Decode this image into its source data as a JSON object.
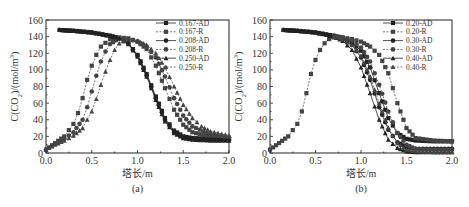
{
  "chart_data": [
    {
      "type": "line",
      "panel_label": "(a)",
      "title": "",
      "xlabel": "塔长/m",
      "ylabel": "C(CO2)/(mol/m3)",
      "ylabel_parts": {
        "pre": "C(CO",
        "sub": "2",
        "mid": ")/(mol/m",
        "sup": "3",
        "post": ")"
      },
      "xlim": [
        0.0,
        2.0
      ],
      "ylim": [
        0,
        160
      ],
      "xticks": [
        0.0,
        0.5,
        1.0,
        1.5,
        2.0
      ],
      "xtick_labels": [
        "0.0",
        "0.5",
        "1.0",
        "1.5",
        "2.0"
      ],
      "yticks": [
        0,
        20,
        40,
        60,
        80,
        100,
        120,
        140,
        160
      ],
      "ytick_labels": [
        "0",
        "20",
        "40",
        "60",
        "80",
        "100",
        "120",
        "140",
        "160"
      ],
      "grid": false,
      "legend_position": "top-right",
      "series": [
        {
          "name": "0.167-AD",
          "style": "solid",
          "marker": "square",
          "x": [
            0.15,
            0.3,
            0.5,
            0.7,
            0.8,
            0.9,
            1.0,
            1.1,
            1.2,
            1.3,
            1.4,
            1.5,
            1.6,
            1.8,
            2.0
          ],
          "y": [
            148,
            147,
            145,
            141,
            138,
            132,
            118,
            95,
            68,
            42,
            27,
            20,
            18,
            17,
            17
          ]
        },
        {
          "name": "0.167-R",
          "style": "dashed",
          "marker": "square",
          "x": [
            0.0,
            0.1,
            0.2,
            0.3,
            0.35,
            0.4,
            0.45,
            0.5,
            0.55,
            0.6,
            0.7,
            0.8,
            0.9,
            1.0,
            1.1,
            1.2,
            1.3,
            1.4,
            1.5,
            1.6,
            1.8,
            2.0
          ],
          "y": [
            4,
            12,
            20,
            35,
            48,
            66,
            88,
            105,
            118,
            128,
            137,
            139,
            138,
            134,
            125,
            105,
            78,
            52,
            34,
            25,
            19,
            17
          ]
        },
        {
          "name": "0.208-AD",
          "style": "solid",
          "marker": "circle",
          "x": [
            0.15,
            0.3,
            0.5,
            0.7,
            0.8,
            0.9,
            1.0,
            1.1,
            1.2,
            1.3,
            1.4,
            1.5,
            1.6,
            1.8,
            2.0
          ],
          "y": [
            148,
            147,
            145,
            141,
            138,
            132,
            117,
            93,
            66,
            40,
            25,
            19,
            17,
            16,
            16
          ]
        },
        {
          "name": "0.208-R",
          "style": "dashed",
          "marker": "circle",
          "x": [
            0.0,
            0.1,
            0.2,
            0.3,
            0.4,
            0.45,
            0.5,
            0.55,
            0.6,
            0.65,
            0.7,
            0.8,
            0.9,
            1.0,
            1.1,
            1.2,
            1.3,
            1.4,
            1.5,
            1.6,
            1.8,
            2.0
          ],
          "y": [
            4,
            11,
            17,
            25,
            40,
            55,
            74,
            93,
            110,
            122,
            131,
            138,
            137,
            134,
            128,
            115,
            92,
            66,
            45,
            32,
            22,
            19
          ]
        },
        {
          "name": "0.250-AD",
          "style": "solid",
          "marker": "triangle",
          "x": [
            0.15,
            0.3,
            0.5,
            0.7,
            0.8,
            0.9,
            1.0,
            1.1,
            1.2,
            1.3,
            1.4,
            1.5,
            1.6,
            1.8,
            2.0
          ],
          "y": [
            148,
            147,
            145,
            141,
            138,
            131,
            116,
            92,
            64,
            38,
            24,
            18,
            16,
            15,
            15
          ]
        },
        {
          "name": "0.250-R",
          "style": "dashed",
          "marker": "triangle",
          "x": [
            0.0,
            0.1,
            0.2,
            0.3,
            0.4,
            0.5,
            0.55,
            0.6,
            0.65,
            0.7,
            0.75,
            0.8,
            0.9,
            1.0,
            1.1,
            1.2,
            1.3,
            1.4,
            1.5,
            1.6,
            1.7,
            1.8,
            2.0
          ],
          "y": [
            4,
            10,
            15,
            21,
            30,
            50,
            65,
            82,
            98,
            112,
            124,
            132,
            137,
            135,
            130,
            120,
            103,
            80,
            58,
            42,
            32,
            26,
            21
          ]
        }
      ]
    },
    {
      "type": "line",
      "panel_label": "(b)",
      "title": "",
      "xlabel": "塔长/m",
      "ylabel": "C(CO2)/(mol/m3)",
      "ylabel_parts": {
        "pre": "C(CO",
        "sub": "2",
        "mid": ")/(mol/m",
        "sup": "3",
        "post": ")"
      },
      "xlim": [
        0.0,
        2.0
      ],
      "ylim": [
        0,
        160
      ],
      "xticks": [
        0.0,
        0.5,
        1.0,
        1.5,
        2.0
      ],
      "xtick_labels": [
        "0.0",
        "0.5",
        "1.0",
        "1.5",
        "2.0"
      ],
      "yticks": [
        0,
        20,
        40,
        60,
        80,
        100,
        120,
        140,
        160
      ],
      "ytick_labels": [
        "0",
        "20",
        "40",
        "60",
        "80",
        "100",
        "120",
        "140",
        "160"
      ],
      "grid": false,
      "legend_position": "top-right",
      "series": [
        {
          "name": "0.20-AD",
          "style": "solid",
          "marker": "square",
          "x": [
            0.15,
            0.3,
            0.5,
            0.7,
            0.8,
            0.9,
            1.0,
            1.1,
            1.2,
            1.3,
            1.4,
            1.5,
            1.6,
            1.8,
            2.0
          ],
          "y": [
            148,
            147,
            145,
            141,
            138,
            133,
            123,
            103,
            72,
            42,
            24,
            17,
            15,
            14,
            14
          ]
        },
        {
          "name": "0.20-R",
          "style": "dashed",
          "marker": "square",
          "x": [
            0.0,
            0.1,
            0.2,
            0.3,
            0.35,
            0.4,
            0.45,
            0.5,
            0.55,
            0.6,
            0.65,
            0.7,
            0.8,
            0.9,
            1.0,
            1.1,
            1.2,
            1.3,
            1.4,
            1.5,
            1.6,
            1.8,
            2.0
          ],
          "y": [
            4,
            12,
            20,
            35,
            50,
            72,
            95,
            112,
            124,
            132,
            137,
            139,
            139,
            137,
            134,
            128,
            118,
            96,
            60,
            30,
            18,
            15,
            14
          ]
        },
        {
          "name": "0.30-AD",
          "style": "solid",
          "marker": "circle",
          "x": [
            0.15,
            0.3,
            0.5,
            0.7,
            0.8,
            0.9,
            1.0,
            1.1,
            1.2,
            1.3,
            1.4,
            1.5,
            1.6,
            1.8,
            2.0
          ],
          "y": [
            148,
            147,
            145,
            141,
            137,
            130,
            115,
            88,
            55,
            28,
            13,
            7,
            5,
            5,
            5
          ]
        },
        {
          "name": "0.30-R",
          "style": "dashed",
          "marker": "circle",
          "x": [
            0.7,
            0.8,
            0.9,
            1.0,
            1.1,
            1.2,
            1.3,
            1.4,
            1.5,
            1.6,
            1.8,
            2.0
          ],
          "y": [
            141,
            139,
            135,
            127,
            110,
            82,
            50,
            24,
            10,
            5,
            4,
            4
          ]
        },
        {
          "name": "0.40-AD",
          "style": "solid",
          "marker": "triangle",
          "x": [
            0.15,
            0.3,
            0.5,
            0.7,
            0.8,
            0.9,
            1.0,
            1.1,
            1.2,
            1.3,
            1.4,
            1.5,
            1.6,
            1.8,
            2.0
          ],
          "y": [
            148,
            147,
            145,
            140,
            135,
            124,
            103,
            72,
            40,
            16,
            6,
            2,
            1,
            1,
            1
          ]
        },
        {
          "name": "0.40-R",
          "style": "dashed",
          "marker": "triangle",
          "x": [
            0.7,
            0.8,
            0.9,
            1.0,
            1.1,
            1.2,
            1.3,
            1.4,
            1.5,
            1.6,
            1.8,
            2.0
          ],
          "y": [
            140,
            137,
            130,
            117,
            92,
            60,
            30,
            12,
            4,
            2,
            1,
            1
          ]
        }
      ]
    }
  ]
}
